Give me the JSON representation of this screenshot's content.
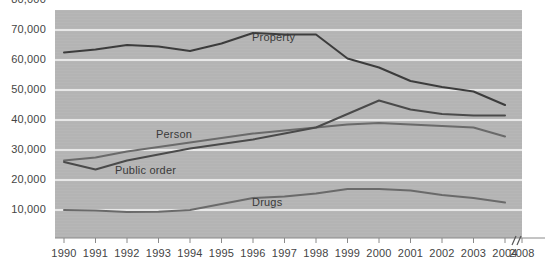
{
  "chart_data": {
    "type": "line",
    "title": "",
    "subtitle": "",
    "xlabel": "",
    "ylabel": "",
    "x": [
      1990,
      1991,
      1992,
      1993,
      1994,
      1995,
      1996,
      1997,
      1998,
      1999,
      2000,
      2001,
      2002,
      2003,
      2004
    ],
    "xtick_labels": [
      "1990",
      "1991",
      "1992",
      "1993",
      "1994",
      "1995",
      "1996",
      "1997",
      "1998",
      "1999",
      "2000",
      "2001",
      "2002",
      "2003",
      "2004",
      "2008"
    ],
    "ytick_labels": [
      "10,000",
      "20,000",
      "30,000",
      "40,000",
      "50,000",
      "60,000",
      "70,000",
      "80,000"
    ],
    "ytick_values": [
      10000,
      20000,
      30000,
      40000,
      50000,
      60000,
      70000,
      80000
    ],
    "ylim": [
      0,
      80000
    ],
    "xlim": [
      1990,
      2008
    ],
    "grid": true,
    "grid_axis": "y",
    "legend_position": "inline-annotations",
    "axis_break": "//",
    "axis_break_label": "2008",
    "plot_background": "#b4b4b4",
    "grid_color": "#e8e8e8",
    "series": [
      {
        "name": "Property",
        "color": "#3c3c3c",
        "label_x": 1996,
        "values": [
          62500,
          63500,
          65000,
          64500,
          63000,
          65500,
          69000,
          68500,
          68500,
          60500,
          57500,
          53000,
          51000,
          49500,
          45000
        ]
      },
      {
        "name": "Person",
        "color": "#6a6a6a",
        "label_x": 1993,
        "values": [
          26500,
          27500,
          29500,
          31000,
          32500,
          34000,
          35500,
          36500,
          37500,
          38500,
          39000,
          38500,
          38000,
          37500,
          34500
        ]
      },
      {
        "name": "Public order",
        "color": "#4a4a4a",
        "label_x": 1993,
        "values": [
          26000,
          23500,
          26500,
          28500,
          30500,
          32000,
          33500,
          35500,
          37500,
          42000,
          46500,
          43500,
          42000,
          41500,
          41500
        ]
      },
      {
        "name": "Drugs",
        "color": "#6a6a6a",
        "label_x": 1999,
        "values": [
          10000,
          9800,
          9300,
          9400,
          10000,
          12000,
          14000,
          14500,
          15500,
          17000,
          17000,
          16500,
          15000,
          14000,
          12500
        ]
      }
    ]
  },
  "series_labels": {
    "property": "Property",
    "person": "Person",
    "public_order": "Public order",
    "drugs": "Drugs"
  }
}
